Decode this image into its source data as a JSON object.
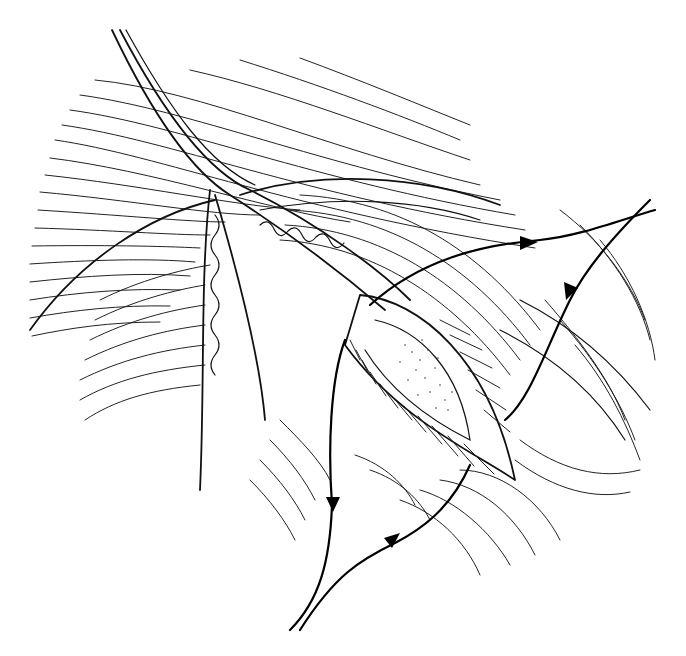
{
  "figure": {
    "title": "",
    "colors": {
      "ink": "#000000",
      "background": "#ffffff"
    },
    "instrument": {
      "shaft_lines": [
        "M112,30 C150,110 190,170 225,190",
        "M118,30 C160,110 200,168 238,186",
        "M124,30 C168,108 212,170 252,182"
      ]
    },
    "sutures": [
      {
        "name": "upper-suture",
        "d": "M370,305 C420,260 480,245 540,240 C580,236 620,220 655,210",
        "arrow": {
          "x": 530,
          "y": 242,
          "angle": -5
        }
      },
      {
        "name": "right-suture",
        "d": "M650,200 C610,240 585,270 570,300 C545,350 530,400 505,420",
        "arrow": {
          "x": 570,
          "y": 290,
          "angle": 115
        }
      },
      {
        "name": "left-suture",
        "d": "M345,340 C330,380 328,450 332,505 C330,560 320,600 290,630",
        "arrow": {
          "x": 333,
          "y": 505,
          "angle": 90
        }
      },
      {
        "name": "lower-suture",
        "d": "M470,465 C450,510 420,530 395,543 C360,560 335,575 300,630",
        "arrow": {
          "x": 397,
          "y": 540,
          "angle": -30
        }
      }
    ]
  }
}
